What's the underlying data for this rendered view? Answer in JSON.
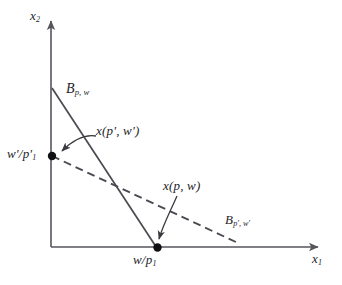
{
  "figure": {
    "kind": "budget-set-diagram",
    "background_color": "#ffffff",
    "ink_color": "#3a3a40",
    "axis_color": "#55555c",
    "marker_color": "#111115"
  },
  "axes": {
    "x_label": "x",
    "x_label_sub": "1",
    "y_label": "x",
    "y_label_sub": "2",
    "origin": {
      "x": 51,
      "y": 247
    }
  },
  "budget_lines": [
    {
      "id": "B_pw",
      "style": "solid",
      "label_base": "B",
      "label_sub": "p, w",
      "x_intercept_label": "w/p",
      "x_intercept_label_sub": "1",
      "from": {
        "x": 52,
        "y": 88
      },
      "to": {
        "x": 157,
        "y": 249
      }
    },
    {
      "id": "B_ppwp",
      "style": "dashed",
      "label_base": "B",
      "label_sub": "p', w'",
      "y_intercept_label": "w'/p'",
      "y_intercept_label_sub": "1",
      "from": {
        "x": 52,
        "y": 156
      },
      "to": {
        "x": 237,
        "y": 243
      }
    }
  ],
  "demand_points": [
    {
      "id": "x_pw",
      "label": "x(p, w)",
      "at": {
        "x": 157,
        "y": 248
      },
      "axis_tick_label": "w/p",
      "axis_tick_sub": "1"
    },
    {
      "id": "x_ppwp",
      "label": "x(p', w')",
      "at": {
        "x": 52,
        "y": 156
      },
      "axis_tick_label": "w'/p'",
      "axis_tick_sub": "1"
    }
  ],
  "labels": {
    "axis_x1": {
      "base": "x",
      "sub": "1"
    },
    "axis_x2": {
      "base": "x",
      "sub": "2"
    },
    "b_pw": {
      "base": "B",
      "sub": "p, w"
    },
    "b_ppwp": {
      "base": "B",
      "sub": "p', w'"
    },
    "x_ppwp": {
      "text": "x(p', w')"
    },
    "x_pw": {
      "text": "x(p, w)"
    },
    "w_prime_over_p_prime_1": {
      "base": "w'/p'",
      "sub": "1"
    },
    "w_over_p_1": {
      "base": "w/p",
      "sub": "1"
    }
  }
}
